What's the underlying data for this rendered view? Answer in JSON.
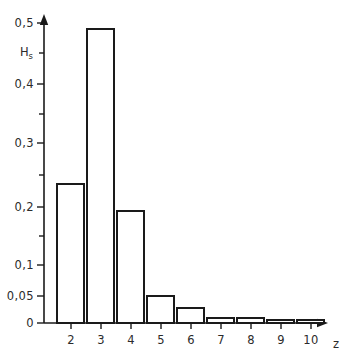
{
  "chart_data": {
    "type": "bar",
    "title": "",
    "subtitle": "",
    "xlabel": "z",
    "ylabel": "H_s",
    "ylabel_display": "H",
    "ylabel_subscript": "s",
    "categories": [
      "2",
      "3",
      "4",
      "5",
      "6",
      "7",
      "8",
      "9",
      "10"
    ],
    "values": [
      0.235,
      0.49,
      0.193,
      0.05,
      0.03,
      0.008,
      0.008,
      0.005,
      0.005
    ],
    "x": [
      2,
      3,
      4,
      5,
      6,
      7,
      8,
      9,
      10
    ],
    "ylim": [
      0,
      0.5
    ],
    "xlim": [
      1.5,
      10.5
    ],
    "y_tick_labels": [
      "0",
      "0,05",
      "0,1",
      "0,2",
      "0,3",
      "0,4",
      "0,5"
    ],
    "y_tick_values": [
      0,
      0.05,
      0.1,
      0.2,
      0.3,
      0.4,
      0.5
    ],
    "y_axis_scale": "non-linear (compressed near zero: 0.05 and 0.1 steps expanded)",
    "y_minor_ticks": [
      0.15,
      0.25,
      0.35,
      0.45
    ],
    "x_tick_labels": [
      "2",
      "3",
      "4",
      "5",
      "6",
      "7",
      "8",
      "9",
      "10"
    ],
    "grid": false,
    "legend": [],
    "legend_position": "none",
    "annotations": [],
    "bar_fill_color": "#ffffff",
    "bar_edge_color": "#1a1a1a",
    "axis_color": "#1a1a1a",
    "background_color": "#ffffff"
  },
  "axes": {
    "y_ticks": [
      {
        "label": "0,5",
        "value": 0.5,
        "y": 23,
        "major": true
      },
      {
        "label": "",
        "value": 0.45,
        "y": 53,
        "major": false
      },
      {
        "label": "0,4",
        "value": 0.4,
        "y": 84,
        "major": true
      },
      {
        "label": "",
        "value": 0.35,
        "y": 114,
        "major": false
      },
      {
        "label": "0,3",
        "value": 0.3,
        "y": 143,
        "major": true
      },
      {
        "label": "",
        "value": 0.25,
        "y": 175,
        "major": false
      },
      {
        "label": "0,2",
        "value": 0.2,
        "y": 207,
        "major": true
      },
      {
        "label": "",
        "value": 0.15,
        "y": 236,
        "major": false
      },
      {
        "label": "0,1",
        "value": 0.1,
        "y": 265,
        "major": true
      },
      {
        "label": "0,05",
        "value": 0.05,
        "y": 296,
        "major": true
      },
      {
        "label": "0",
        "value": 0,
        "y": 323,
        "major": true
      }
    ],
    "x_ticks": [
      {
        "label": "2",
        "x": 71
      },
      {
        "label": "3",
        "x": 101
      },
      {
        "label": "4",
        "x": 131
      },
      {
        "label": "5",
        "x": 161
      },
      {
        "label": "6",
        "x": 191
      },
      {
        "label": "7",
        "x": 221
      },
      {
        "label": "8",
        "x": 251
      },
      {
        "label": "9",
        "x": 281
      },
      {
        "label": "10",
        "x": 311
      }
    ],
    "y_axis_label_y": 53,
    "x_axis_label_x": 333,
    "x_axis_label_y": 337
  },
  "bars": [
    {
      "category": "2",
      "value": 0.235,
      "x": 57,
      "width": 27,
      "top": 184,
      "bottom": 323
    },
    {
      "category": "3",
      "value": 0.49,
      "x": 87,
      "width": 27,
      "top": 29,
      "bottom": 323
    },
    {
      "category": "4",
      "value": 0.193,
      "x": 117,
      "width": 27,
      "top": 211,
      "bottom": 323
    },
    {
      "category": "5",
      "value": 0.05,
      "x": 147,
      "width": 27,
      "top": 296,
      "bottom": 323
    },
    {
      "category": "6",
      "value": 0.03,
      "x": 177,
      "width": 27,
      "top": 308,
      "bottom": 323
    },
    {
      "category": "7",
      "value": 0.008,
      "x": 207,
      "width": 27,
      "top": 318,
      "bottom": 323
    },
    {
      "category": "8",
      "value": 0.008,
      "x": 237,
      "width": 27,
      "top": 318,
      "bottom": 323
    },
    {
      "category": "9",
      "value": 0.005,
      "x": 267,
      "width": 27,
      "top": 320,
      "bottom": 323
    },
    {
      "category": "10",
      "value": 0.005,
      "x": 297,
      "width": 27,
      "top": 320,
      "bottom": 323
    }
  ]
}
